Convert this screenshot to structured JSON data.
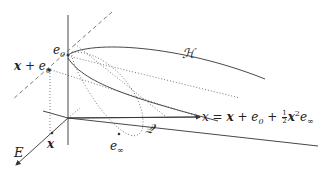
{
  "diagram": {
    "title": "",
    "labels": {
      "e0": "e",
      "e0_sub": "0",
      "x_plus_e0_x": "x",
      "x_plus_e0_plus": " + e",
      "x_plus_e0_sub": "0",
      "H": "ℋ",
      "formula_lhs": "x = ",
      "formula_x": "x",
      "formula_mid": " + e",
      "formula_sub0": "0",
      "formula_plus": " + ",
      "frac_num": "1",
      "frac_den": "2",
      "formula_x2": "x",
      "formula_sup2": "2",
      "formula_e": "e",
      "formula_subinf": "∞",
      "Q": "𝒬",
      "x_bold": "x",
      "e_inf": "e",
      "e_inf_sub": "∞",
      "E": "E"
    },
    "colors": {
      "stroke": "#333333",
      "text": "#222222",
      "background": "#ffffff"
    }
  }
}
